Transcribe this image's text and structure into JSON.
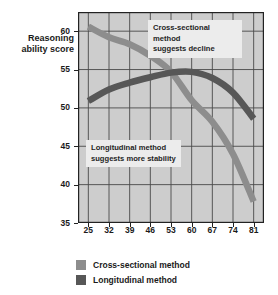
{
  "chart_data": {
    "type": "line",
    "title": "",
    "xlabel": "Age in years",
    "ylabel": "Reasoning ability score",
    "xlim": [
      21.5,
      84.5
    ],
    "ylim": [
      35,
      62.5
    ],
    "xticks": [
      "25",
      "32",
      "39",
      "46",
      "53",
      "60",
      "67",
      "74",
      "81"
    ],
    "yticks": [
      "35",
      "40",
      "45",
      "50",
      "55",
      "60"
    ],
    "grid": true,
    "legend_position": "bottom-left",
    "x": [
      25,
      32,
      39,
      46,
      53,
      60,
      67,
      74,
      81
    ],
    "series": [
      {
        "name": "Cross-sectional method",
        "color": "#8d8d8d",
        "values": [
          60.6,
          59.2,
          58.3,
          56.8,
          54.7,
          51.0,
          48.2,
          44.0,
          37.8
        ]
      },
      {
        "name": "Longitudinal method",
        "color": "#575757",
        "values": [
          50.9,
          52.4,
          53.3,
          54.0,
          54.6,
          54.7,
          53.9,
          52.0,
          48.6
        ]
      }
    ],
    "annotations": [
      {
        "id": "cross-sectional",
        "line1": "Cross-sectional method",
        "line2": "suggests decline"
      },
      {
        "id": "longitudinal",
        "line1": "Longitudinal method",
        "line2": "suggests more stability"
      }
    ],
    "plot_background": "#cdcdcd",
    "grid_color": "#4a4a4a",
    "axis_color": "#222222"
  },
  "axis": {
    "ylabel_line1": "Reasoning",
    "ylabel_line2": "ability score",
    "xlabel": "Age in years"
  },
  "legend": {
    "items": [
      {
        "label": "Cross-sectional method",
        "color": "#8d8d8d"
      },
      {
        "label": "Longitudinal method",
        "color": "#575757"
      }
    ]
  }
}
